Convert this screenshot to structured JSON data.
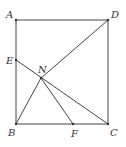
{
  "figure": {
    "type": "geometry",
    "colors": {
      "stroke": "#444444",
      "label": "#333333",
      "background": "#ffffff"
    },
    "points": {
      "A": {
        "label": "A",
        "x": 16,
        "y": 20
      },
      "D": {
        "label": "D",
        "x": 108,
        "y": 20
      },
      "B": {
        "label": "B",
        "x": 16,
        "y": 124
      },
      "C": {
        "label": "C",
        "x": 108,
        "y": 124
      },
      "E": {
        "label": "E",
        "x": 16,
        "y": 60
      },
      "F": {
        "label": "F",
        "x": 73,
        "y": 124
      },
      "N": {
        "label": "N",
        "x": 41,
        "y": 78
      }
    },
    "segments": [
      [
        "A",
        "D"
      ],
      [
        "D",
        "C"
      ],
      [
        "C",
        "B"
      ],
      [
        "B",
        "A"
      ],
      [
        "E",
        "C"
      ],
      [
        "D",
        "N"
      ],
      [
        "B",
        "N"
      ],
      [
        "N",
        "F"
      ]
    ]
  }
}
